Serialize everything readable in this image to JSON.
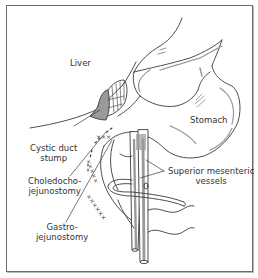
{
  "figure": {
    "labels": {
      "liver": "Liver",
      "stomach": "Stomach",
      "cystic_duct_stump_line1": "Cystic duct",
      "cystic_duct_stump_line2": "stump",
      "choledocho_line1": "Choledocho-",
      "choledocho_line2": "jejunostomy",
      "gastro_line1": "Gastro-",
      "gastro_line2": "jejunostomy",
      "smv_line1": "Superior mesenteric",
      "smv_line2": "vessels"
    },
    "colors": {
      "line": "#3a3a3a",
      "shade": "#9a9a9a",
      "frame": "#6a6a6a",
      "background": "#ffffff"
    }
  }
}
